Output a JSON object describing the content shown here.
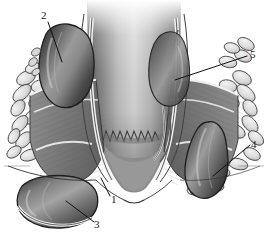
{
  "figure": {
    "style": "grayscale medical line-and-tone illustration",
    "background_color": "#ffffff",
    "width": 268,
    "height": 235
  },
  "labels": [
    {
      "id": "1",
      "text": "1",
      "target": "anal-margin-verge",
      "x": 111,
      "y": 194
    },
    {
      "id": "2",
      "text": "2",
      "target": "internal-hemorrhoid-left",
      "x": 41,
      "y": 10
    },
    {
      "id": "3",
      "text": "3",
      "target": "external-hemorrhoid-left",
      "x": 94,
      "y": 219
    },
    {
      "id": "4",
      "text": "4",
      "target": "external-hemorrhoid-right",
      "x": 251,
      "y": 139
    },
    {
      "id": "5",
      "text": "5",
      "target": "rectal-wall-vein-right",
      "x": 250,
      "y": 49
    }
  ],
  "leader_lines": [
    {
      "for": "1",
      "from": [
        110,
        196
      ],
      "to": [
        101,
        178
      ]
    },
    {
      "for": "2",
      "from": [
        48,
        22
      ],
      "to": [
        62,
        62
      ]
    },
    {
      "for": "3",
      "from": [
        94,
        222
      ],
      "to": [
        66,
        201
      ]
    },
    {
      "for": "4",
      "from": [
        250,
        145
      ],
      "to": [
        213,
        176
      ]
    },
    {
      "for": "5",
      "from": [
        247,
        56
      ],
      "to": [
        175,
        80
      ]
    }
  ],
  "structures": {
    "rectal_lumen": "central vertical canal with smooth vertical tonal gradient",
    "dentate_line": "jagged zigzag border at base of central canal",
    "internal_sphincter": "pale band flanking the canal",
    "external_sphincter": "mid-gray striated muscle bands on both sides",
    "levator_ani": "diagonal striated muscle band running upward-outward",
    "ischiorectal_fat": "cobblestone cluster of pale lobules filling lateral spaces",
    "hemorrhoids": "four dark glossy vascular bulges, two internal and two external"
  },
  "palette": {
    "background": "#ffffff",
    "outline": "#1a1a1a",
    "hemorrhoid_dark": "#3a3a3a",
    "hemorrhoid_mid": "#6e6e6e",
    "hemorrhoid_highlight": "#b9b9b9",
    "muscle_gray": "#8d8d8d",
    "muscle_dark": "#5d5d5d",
    "fat_light": "#e6e6e6",
    "fat_shadow": "#b0b0b0",
    "lumen_light": "#dcdcdc",
    "lumen_dark": "#7d7d7d",
    "label_text": "#1a1a1a"
  }
}
